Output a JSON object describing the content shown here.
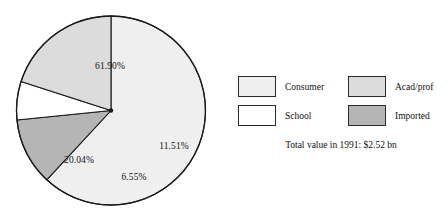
{
  "chart_data": {
    "type": "pie",
    "title": "",
    "subtitle": "",
    "annotation": "Total value in 1991: $2.52 bn",
    "categories": [
      "Consumer",
      "Imported",
      "School",
      "Acad/prof"
    ],
    "values": [
      61.9,
      11.51,
      6.55,
      20.04
    ],
    "value_unit": "%",
    "data_labels": [
      "61.90%",
      "11.51%",
      "6.55%",
      "20.04%"
    ],
    "colors": [
      "#efefef",
      "#b5b5b5",
      "#ffffff",
      "#dcdcdc"
    ],
    "start_angle_deg": 0,
    "direction": "clockwise",
    "legend_position": "right",
    "grid": false,
    "total_label": "100.00%"
  },
  "pie": {
    "slices": [
      {
        "name": "Consumer",
        "label": "61.90%",
        "value": 61.9,
        "color": "#efefef",
        "label_x": 110,
        "label_y": 66
      },
      {
        "name": "Imported",
        "label": "11.51%",
        "value": 11.51,
        "color": "#b5b5b5",
        "label_x": 174,
        "label_y": 146
      },
      {
        "name": "School",
        "label": "6.55%",
        "value": 6.55,
        "color": "#ffffff",
        "label_x": 134,
        "label_y": 177
      },
      {
        "name": "Acad/prof",
        "label": "20.04%",
        "value": 20.04,
        "color": "#dcdcdc",
        "label_x": 79,
        "label_y": 160
      }
    ]
  },
  "legend": {
    "entries": [
      {
        "label": "Consumer",
        "color": "#efefef"
      },
      {
        "label": "Acad/prof",
        "color": "#dcdcdc"
      },
      {
        "label": "School",
        "color": "#ffffff"
      },
      {
        "label": "Imported",
        "color": "#b5b5b5"
      }
    ],
    "footer": "Total value in 1991: $2.52 bn"
  }
}
